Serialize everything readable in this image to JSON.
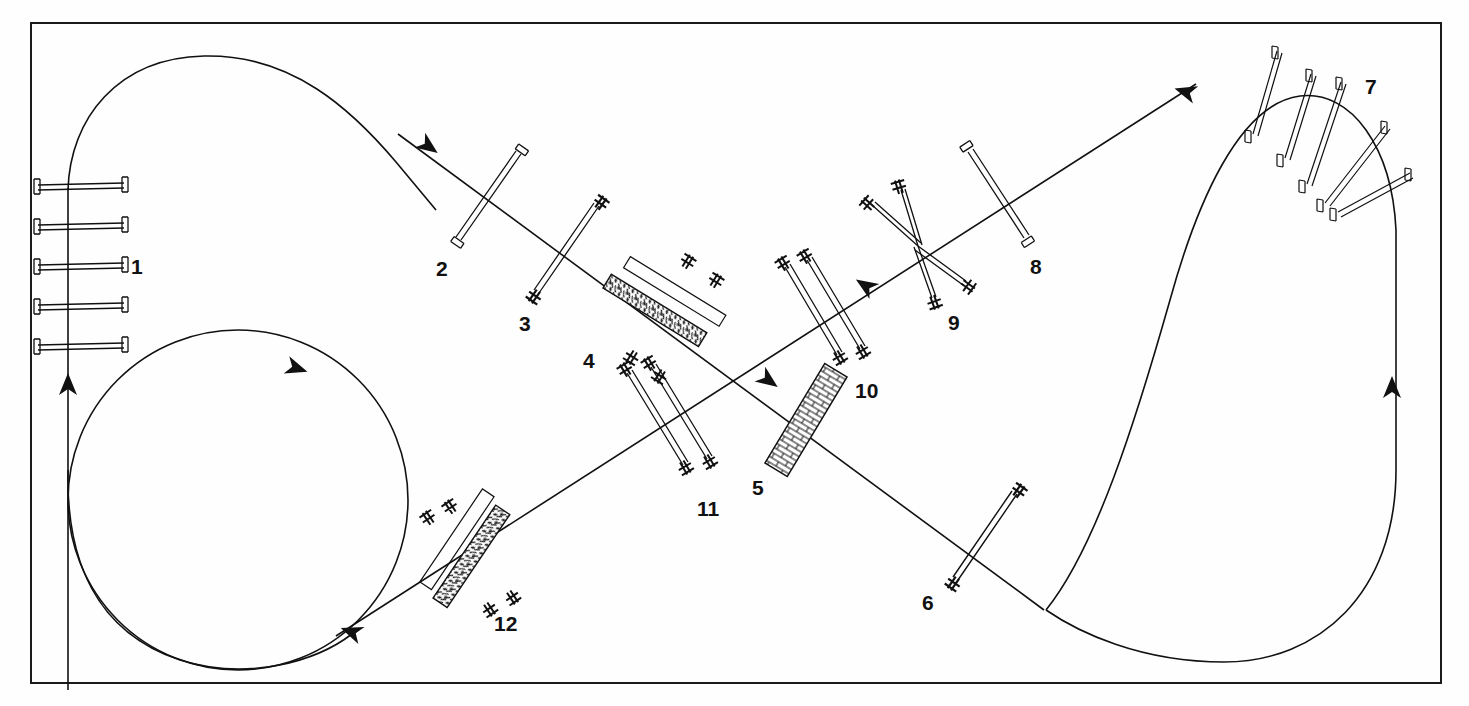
{
  "figure": {
    "kind": "technical-line-drawing",
    "title": "",
    "frame": {
      "x": 30,
      "y": 22,
      "width": 1412,
      "height": 662,
      "stroke": "#1a1a1a",
      "stroke_width": 2
    },
    "background": "#fefefe",
    "ink": "#111111"
  },
  "paths": [
    {
      "name": "left-straight-entry",
      "type": "line",
      "d": "M 68 684 L 68 188",
      "direction": "up"
    },
    {
      "name": "left-upper-loop",
      "type": "curve",
      "d": "M 68 188 C 74 120 120 62 200 58 C 290 54 352 110 392 160 L 430 198",
      "direction": "right-down"
    },
    {
      "name": "main-diagonal-descending",
      "type": "line",
      "d": "M 392 138 L 1040 612",
      "direction": "down-right"
    },
    {
      "name": "main-diagonal-ascending",
      "type": "line",
      "d": "M 338 634 L 1190 88",
      "direction": "up-right"
    },
    {
      "name": "left-large-circle",
      "type": "circle",
      "cx": 238,
      "cy": 500,
      "r": 170,
      "direction": "clockwise"
    },
    {
      "name": "right-upper-curve",
      "type": "curve",
      "d": "M 1040 612 C 1120 520 1180 200 1270 120 C 1330 70 1380 110 1398 190 L 1398 396",
      "direction": "left-up"
    },
    {
      "name": "right-lower-uturn",
      "type": "curve",
      "d": "M 1398 396 L 1398 460 C 1398 600 1300 660 1200 660 C 1100 660 1040 612 1040 612",
      "direction": "down"
    }
  ],
  "arrows": [
    {
      "name": "arrow-left-entry-up",
      "x": 68,
      "y": 385,
      "angle": -90
    },
    {
      "name": "arrow-upper-left-diagonal",
      "x": 428,
      "y": 146,
      "angle": 36
    },
    {
      "name": "arrow-mid-diagonal",
      "x": 768,
      "y": 380,
      "angle": 36
    },
    {
      "name": "arrow-circle-top",
      "x": 296,
      "y": 368,
      "angle": 20
    },
    {
      "name": "arrow-circle-bottom-left",
      "x": 352,
      "y": 632,
      "angle": 200
    },
    {
      "name": "arrow-mid-right-ascending",
      "x": 866,
      "y": 286,
      "angle": 212
    },
    {
      "name": "arrow-top-right-curve",
      "x": 1186,
      "y": 92,
      "angle": 200
    },
    {
      "name": "arrow-right-straight-up",
      "x": 1392,
      "y": 388,
      "angle": -90
    }
  ],
  "elements": [
    {
      "id": "1",
      "label": "1",
      "label_x": 131,
      "label_y": 256,
      "type": "stacked-barriers",
      "description": "five parallel horizontal barrier bars crossed by vertical path",
      "count": 5,
      "bars": [
        {
          "x1": 34,
          "y1": 185,
          "x2": 128,
          "y2": 183
        },
        {
          "x1": 34,
          "y1": 225,
          "x2": 128,
          "y2": 223
        },
        {
          "x1": 34,
          "y1": 265,
          "x2": 128,
          "y2": 263
        },
        {
          "x1": 34,
          "y1": 305,
          "x2": 128,
          "y2": 303
        },
        {
          "x1": 34,
          "y1": 345,
          "x2": 128,
          "y2": 343
        }
      ],
      "end_cap": "I-beam"
    },
    {
      "id": "2",
      "label": "2",
      "label_x": 436,
      "label_y": 258,
      "type": "single-barrier",
      "description": "single diagonal barrier with T ends",
      "bars": [
        {
          "x1": 455,
          "y1": 238,
          "x2": 515,
          "y2": 152
        }
      ],
      "end_cap": "T"
    },
    {
      "id": "3",
      "label": "3",
      "label_x": 522,
      "label_y": 315,
      "type": "single-barrier",
      "description": "single diagonal barrier with cross ends",
      "bars": [
        {
          "x1": 533,
          "y1": 291,
          "x2": 594,
          "y2": 203
        }
      ],
      "end_cap": "cross"
    },
    {
      "id": "4",
      "label": "4",
      "label_x": 585,
      "label_y": 352,
      "type": "double-barrier-hatched",
      "description": "paired barriers with dense stone hatching panel",
      "bars": [
        {
          "x1": 630,
          "y1": 352,
          "x2": 684,
          "y2": 262
        },
        {
          "x1": 657,
          "y1": 370,
          "x2": 712,
          "y2": 281
        }
      ],
      "hatch": "stone",
      "end_cap": "cross"
    },
    {
      "id": "5",
      "label": "5",
      "label_x": 754,
      "label_y": 488,
      "type": "masonry-wall",
      "description": "brick-hatched rectangular wall block",
      "bars": [
        {
          "x1": 779,
          "y1": 466,
          "x2": 836,
          "y2": 372
        }
      ],
      "hatch": "brick",
      "width": 26
    },
    {
      "id": "6",
      "label": "6",
      "label_x": 924,
      "label_y": 604,
      "type": "single-barrier",
      "description": "single diagonal barrier with cross ends",
      "bars": [
        {
          "x1": 952,
          "y1": 578,
          "x2": 1012,
          "y2": 491
        }
      ],
      "end_cap": "cross"
    },
    {
      "id": "7",
      "label": "7",
      "label_x": 1368,
      "label_y": 85,
      "type": "radial-barrier-fan",
      "description": "six barriers arranged radially along the outer curve",
      "count": 6,
      "bars": [
        {
          "x1": 1251,
          "y1": 133,
          "x2": 1276,
          "y2": 50
        },
        {
          "x1": 1283,
          "y1": 157,
          "x2": 1310,
          "y2": 73
        },
        {
          "x1": 1305,
          "y1": 183,
          "x2": 1340,
          "y2": 80
        },
        {
          "x1": 1327,
          "y1": 201,
          "x2": 1386,
          "y2": 124
        },
        {
          "x1": 1338,
          "y1": 211,
          "x2": 1410,
          "y2": 172
        }
      ],
      "end_cap": "I-beam"
    },
    {
      "id": "8",
      "label": "8",
      "label_x": 1032,
      "label_y": 268,
      "type": "single-barrier",
      "description": "single diagonal barrier with I ends",
      "bars": [
        {
          "x1": 966,
          "y1": 150,
          "x2": 1024,
          "y2": 238
        }
      ],
      "end_cap": "I-beam"
    },
    {
      "id": "9",
      "label": "9",
      "label_x": 950,
      "label_y": 324,
      "type": "star-barrier-cluster",
      "description": "four barriers radiating from a common centre point",
      "count": 4,
      "center": {
        "x": 918,
        "y": 246
      },
      "bars": [
        {
          "x1": 918,
          "y1": 246,
          "x2": 872,
          "y2": 205
        },
        {
          "x1": 918,
          "y1": 246,
          "x2": 902,
          "y2": 190
        },
        {
          "x1": 918,
          "y1": 246,
          "x2": 936,
          "y2": 296
        },
        {
          "x1": 918,
          "y1": 246,
          "x2": 966,
          "y2": 281
        }
      ],
      "end_cap": "cross"
    },
    {
      "id": "10",
      "label": "10",
      "label_x": 858,
      "label_y": 392,
      "type": "double-barrier",
      "description": "paired parallel barriers with cross ends",
      "bars": [
        {
          "x1": 784,
          "y1": 266,
          "x2": 836,
          "y2": 354
        },
        {
          "x1": 806,
          "y1": 259,
          "x2": 860,
          "y2": 348
        }
      ],
      "end_cap": "cross"
    },
    {
      "id": "11",
      "label": "11",
      "label_x": 700,
      "label_y": 510,
      "type": "double-barrier",
      "description": "paired parallel barriers with cross ends",
      "bars": [
        {
          "x1": 626,
          "y1": 372,
          "x2": 682,
          "y2": 464
        },
        {
          "x1": 650,
          "y1": 366,
          "x2": 706,
          "y2": 458
        }
      ],
      "end_cap": "cross"
    },
    {
      "id": "12",
      "label": "12",
      "label_x": 496,
      "label_y": 625,
      "type": "double-barrier-hatched",
      "description": "paired barriers with dense stone hatching panel",
      "bars": [
        {
          "x1": 430,
          "y1": 518,
          "x2": 488,
          "y2": 604
        },
        {
          "x1": 452,
          "y1": 508,
          "x2": 512,
          "y2": 592
        }
      ],
      "hatch": "stone",
      "end_cap": "cross"
    }
  ]
}
